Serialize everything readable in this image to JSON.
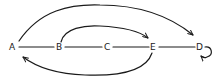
{
  "diagram": {
    "type": "directed-graph",
    "style": "hand-drawn",
    "stroke_color": "#1a1a1a",
    "background": "#ffffff",
    "nodes": [
      {
        "id": "A",
        "label": "A",
        "x": 12,
        "y": 49
      },
      {
        "id": "B",
        "label": "B",
        "x": 59,
        "y": 49
      },
      {
        "id": "C",
        "label": "C",
        "x": 107,
        "y": 49
      },
      {
        "id": "E",
        "label": "E",
        "x": 153,
        "y": 49
      },
      {
        "id": "D",
        "label": "D",
        "x": 200,
        "y": 49
      }
    ],
    "edges": [
      {
        "from": "A",
        "to": "B",
        "directed": false,
        "shape": "straight"
      },
      {
        "from": "B",
        "to": "C",
        "directed": false,
        "shape": "straight"
      },
      {
        "from": "C",
        "to": "E",
        "directed": false,
        "shape": "straight"
      },
      {
        "from": "E",
        "to": "D",
        "directed": false,
        "shape": "straight"
      },
      {
        "from": "A",
        "to": "D",
        "directed": true,
        "shape": "arc-top"
      },
      {
        "from": "B",
        "to": "E",
        "directed": true,
        "shape": "arc-top"
      },
      {
        "from": "E",
        "to": "A",
        "directed": true,
        "shape": "arc-bottom"
      },
      {
        "from": "D",
        "to": "D",
        "directed": true,
        "shape": "self-loop"
      }
    ]
  }
}
